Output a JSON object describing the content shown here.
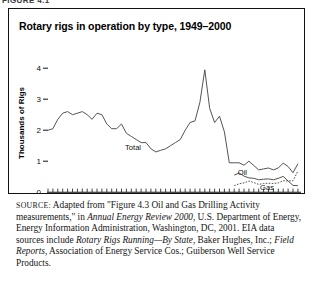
{
  "page": {
    "cut_off_header": "FIGURE 4.1"
  },
  "figure": {
    "title": "Rotary rigs in operation by type, 1949–2000"
  },
  "chart_data": {
    "type": "line",
    "title": "Rotary rigs in operation by type, 1949–2000",
    "xlabel": "",
    "ylabel": "Thousands of Rigs",
    "xlim": [
      1949,
      2000
    ],
    "ylim": [
      0,
      4.3
    ],
    "yticks": [
      0,
      1,
      2,
      3,
      4
    ],
    "ytick_labels": [
      "0",
      "1",
      "2",
      "3",
      "4"
    ],
    "xticks": [
      1950,
      1955,
      1960,
      1965,
      1970,
      1975,
      1980,
      1985,
      1990,
      1995,
      2000
    ],
    "xtick_labels": [
      "1950",
      "1955",
      "1960",
      "1965",
      "1970",
      "1975",
      "1980",
      "1985",
      "1990",
      "1995",
      "2000"
    ],
    "minor_xtick_interval": 1,
    "grid": false,
    "legend": "inline-annotations",
    "annotations": [
      {
        "text": "Total",
        "x": 1967,
        "y": 1.62
      },
      {
        "text": "Oil",
        "x": 1985.2,
        "y": 0.62
      },
      {
        "text": "Gas",
        "x": 1989.0,
        "y": 0.16
      }
    ],
    "series": [
      {
        "name": "Total",
        "style": "solid",
        "color": "#55544f",
        "x": [
          1949,
          1950,
          1951,
          1952,
          1953,
          1954,
          1955,
          1956,
          1957,
          1958,
          1959,
          1960,
          1961,
          1962,
          1963,
          1964,
          1965,
          1966,
          1967,
          1968,
          1969,
          1970,
          1971,
          1972,
          1973,
          1974,
          1975,
          1976,
          1977,
          1978,
          1979,
          1980,
          1981,
          1982,
          1983,
          1984,
          1985,
          1986,
          1987,
          1988,
          1989,
          1990,
          1991,
          1992,
          1993,
          1994,
          1995,
          1996,
          1997,
          1998,
          1999,
          2000
        ],
        "values": [
          2.0,
          2.05,
          2.35,
          2.55,
          2.6,
          2.5,
          2.55,
          2.6,
          2.5,
          2.35,
          2.55,
          2.5,
          2.2,
          2.05,
          2.05,
          2.2,
          1.9,
          1.8,
          1.7,
          1.6,
          1.6,
          1.4,
          1.3,
          1.35,
          1.4,
          1.5,
          1.6,
          1.7,
          2.0,
          2.25,
          2.3,
          2.9,
          3.95,
          2.7,
          2.25,
          2.45,
          1.95,
          0.95,
          0.95,
          0.95,
          0.87,
          1.0,
          0.86,
          0.72,
          0.75,
          0.78,
          0.72,
          0.78,
          0.94,
          0.83,
          0.63,
          0.92
        ]
      },
      {
        "name": "Oil",
        "style": "solid",
        "color": "#55544f",
        "x": [
          1987,
          1988,
          1989,
          1990,
          1991,
          1992,
          1993,
          1994,
          1995,
          1996,
          1997,
          1998,
          1999,
          2000
        ],
        "values": [
          0.55,
          0.62,
          0.52,
          0.46,
          0.45,
          0.4,
          0.42,
          0.43,
          0.4,
          0.45,
          0.51,
          0.36,
          0.22,
          0.21
        ]
      },
      {
        "name": "Gas",
        "style": "dotted",
        "color": "#55544f",
        "x": [
          1987,
          1988,
          1989,
          1990,
          1991,
          1992,
          1993,
          1994,
          1995,
          1996,
          1997,
          1998,
          1999,
          2000
        ],
        "values": [
          0.21,
          0.27,
          0.3,
          0.36,
          0.31,
          0.25,
          0.28,
          0.29,
          0.28,
          0.3,
          0.37,
          0.36,
          0.37,
          0.68
        ]
      }
    ]
  },
  "source": {
    "label": "SOURCE:",
    "line1_a": " Adapted from \"Figure 4.3 Oil and Gas Drilling Activity measurements,\" in ",
    "italic1": "Annual Energy Review 2000",
    "line1_b": ", U.S. Department of Energy, Energy Information Administration, Washington, DC, 2001. EIA data sources include ",
    "italic2": "Rotary Rigs Running—By State",
    "line2_b": ", Baker Hughes, Inc.; ",
    "italic3": "Field Reports",
    "line2_c": ", Association of Energy Service Cos.; Guiberson Well Service Products."
  }
}
